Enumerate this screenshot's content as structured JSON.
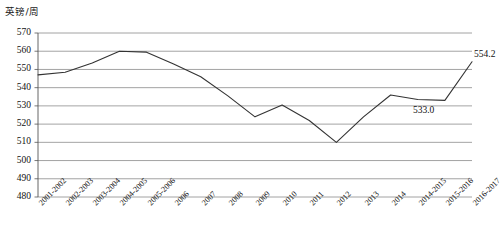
{
  "axis_title": "英镑/周",
  "chart_data": {
    "type": "line",
    "title": "",
    "subtitle": "",
    "xlabel": "",
    "ylabel": "英镑/周",
    "ylim": [
      480,
      570
    ],
    "ytick_step": 10,
    "yticks": [
      570,
      560,
      550,
      540,
      530,
      520,
      510,
      500,
      490,
      480
    ],
    "grid": true,
    "legend": false,
    "legend_position": "none",
    "categories": [
      "2001-2002",
      "2002-2003",
      "2003-2004",
      "2004-2005",
      "2005-2006",
      "2006",
      "2007",
      "2008",
      "2009",
      "2010",
      "2011",
      "2012",
      "2013",
      "2014",
      "2014-2015",
      "2015-2016",
      "2016-2017"
    ],
    "series": [
      {
        "name": "英镑/周",
        "values": [
          547.0,
          548.5,
          553.5,
          560.0,
          559.5,
          553.0,
          546.0,
          535.5,
          524.0,
          530.5,
          522.0,
          510.0,
          524.0,
          536.0,
          533.5,
          533.0,
          554.2
        ]
      }
    ],
    "annotations": [
      {
        "text": "533.0",
        "category": "2015-2016",
        "value": 533.0
      },
      {
        "text": "554.2",
        "category": "2016-2017",
        "value": 554.2
      }
    ],
    "line_color": "#333333"
  },
  "colors": {
    "line": "#333333",
    "grid": "#8c8c8c",
    "axis": "#555555",
    "text": "#111111",
    "background": "#ffffff"
  }
}
